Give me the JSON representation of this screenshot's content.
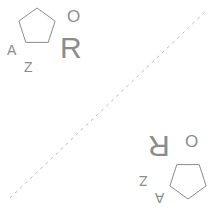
{
  "image": {
    "width": 208,
    "height": 209,
    "background_color": "#ffffff",
    "stroke_color": "#8c8c8c",
    "axis_color": "#b9b9c6"
  },
  "figure": {
    "title": ""
  },
  "axis_line": {
    "style": "dashed",
    "x1": 10,
    "y1": 198,
    "x2": 205,
    "y2": 12
  },
  "groups": [
    {
      "name": "upper-left-group",
      "rotation_degrees": 0,
      "items": [
        {
          "kind": "pentagon",
          "name": "pentagon",
          "cx": 37,
          "cy": 27,
          "r": 19,
          "rotation": 0
        },
        {
          "kind": "letter",
          "name": "letter-a",
          "text": "A",
          "x": 7,
          "y": 43,
          "size": 14
        },
        {
          "kind": "letter",
          "name": "letter-z",
          "text": "Z",
          "x": 24,
          "y": 60,
          "size": 14
        },
        {
          "kind": "letter",
          "name": "letter-r",
          "text": "R",
          "x": 60,
          "y": 33,
          "size": 30
        },
        {
          "kind": "letter",
          "name": "letter-o",
          "text": "O",
          "x": 67,
          "y": 8,
          "size": 17
        }
      ]
    },
    {
      "name": "lower-right-group",
      "rotation_degrees": 180,
      "items": [
        {
          "kind": "pentagon",
          "name": "pentagon",
          "cx": 188,
          "cy": 180,
          "r": 19,
          "rotation": 180
        },
        {
          "kind": "letter",
          "name": "letter-a",
          "text": "A",
          "x": 155,
          "y": 191,
          "size": 14
        },
        {
          "kind": "letter",
          "name": "letter-z",
          "text": "Z",
          "x": 139,
          "y": 174,
          "size": 14
        },
        {
          "kind": "letter",
          "name": "letter-r",
          "text": "R",
          "x": 148,
          "y": 131,
          "size": 30
        },
        {
          "kind": "letter",
          "name": "letter-o",
          "text": "O",
          "x": 185,
          "y": 132,
          "size": 17
        }
      ]
    }
  ]
}
